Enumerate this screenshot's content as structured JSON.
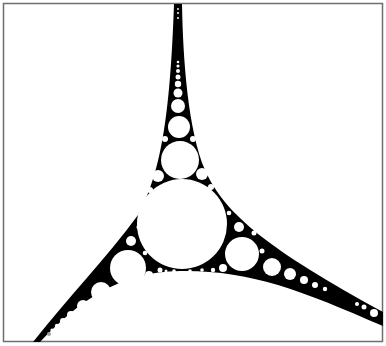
{
  "figure": {
    "title": "Apollonian gasket",
    "colors": {
      "background": "#ffffff",
      "fill": "#000000",
      "frame": "#6e6e6e",
      "marker": "#a0a0a0"
    }
  }
}
